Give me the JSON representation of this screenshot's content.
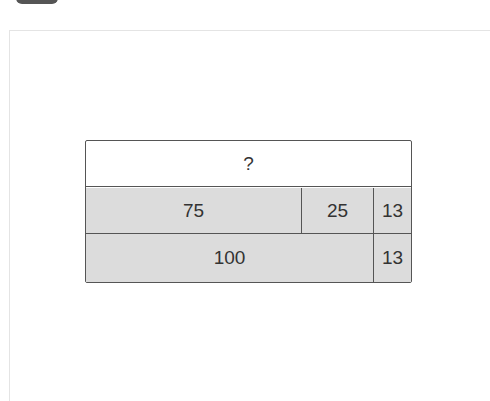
{
  "bar_model": {
    "top": "?",
    "row1": [
      "75",
      "25",
      "13"
    ],
    "row2": [
      "100",
      "13"
    ]
  },
  "colors": {
    "fill": "#dcdcdc",
    "border": "#555555"
  }
}
